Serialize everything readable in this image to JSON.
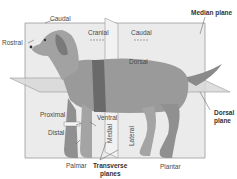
{
  "diagram": {
    "labels": {
      "caudal_top": "Caudal",
      "rostral": "Rostral",
      "cranial": "Cranial",
      "caudal": "Caudal",
      "median_plane": "Median plane",
      "dorsal": "Dorsal",
      "dorsal_plane_line1": "Dorsal",
      "dorsal_plane_line2": "plane",
      "proximal": "Proximal",
      "distal": "Distal",
      "ventral": "Ventral",
      "medial": "Medial",
      "lateral": "Lateral",
      "palmar": "Palmar",
      "transverse_line1": "Transverse",
      "transverse_line2": "planes",
      "plantar": "Plantar"
    },
    "colors": {
      "plane_fill": "#e6e6e6",
      "plane_edge": "#8a8a8a",
      "dog_body": "#9a9a9a",
      "dog_shadow": "#6e6e6e",
      "band": "#5a5a5a",
      "text": "#4a4a4a"
    }
  }
}
